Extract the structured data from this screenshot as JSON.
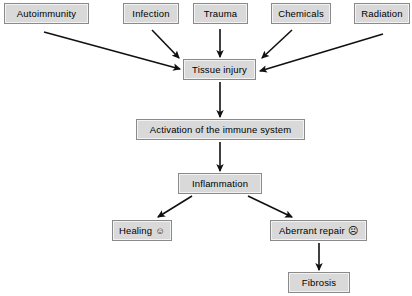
{
  "diagram": {
    "colors": {
      "box_fill": "#d9d9d9",
      "box_border": "#8a8a8a",
      "arrow": "#111111",
      "background": "#ffffff",
      "text": "#000000"
    },
    "nodes": [
      {
        "id": "autoimmunity",
        "label": "Autoimmunity",
        "x": 4,
        "y": 3,
        "w": 85,
        "h": 21,
        "face": ""
      },
      {
        "id": "infection",
        "label": "Infection",
        "x": 123,
        "y": 3,
        "w": 56,
        "h": 21,
        "face": ""
      },
      {
        "id": "trauma",
        "label": "Trauma",
        "x": 193,
        "y": 3,
        "w": 55,
        "h": 21,
        "face": ""
      },
      {
        "id": "chemicals",
        "label": "Chemicals",
        "x": 271,
        "y": 3,
        "w": 60,
        "h": 21,
        "face": ""
      },
      {
        "id": "radiation",
        "label": "Radiation",
        "x": 354,
        "y": 3,
        "w": 56,
        "h": 21,
        "face": ""
      },
      {
        "id": "tissue-injury",
        "label": "Tissue injury",
        "x": 183,
        "y": 59,
        "w": 73,
        "h": 21,
        "face": ""
      },
      {
        "id": "activation",
        "label": "Activation of the immune system",
        "x": 136,
        "y": 119,
        "w": 169,
        "h": 21,
        "face": ""
      },
      {
        "id": "inflammation",
        "label": "Inflammation",
        "x": 178,
        "y": 173,
        "w": 84,
        "h": 21,
        "face": ""
      },
      {
        "id": "healing",
        "label": "Healing",
        "x": 112,
        "y": 220,
        "w": 60,
        "h": 21,
        "face": "☺"
      },
      {
        "id": "aberrant-repair",
        "label": "Aberrant repair",
        "x": 270,
        "y": 220,
        "w": 97,
        "h": 21,
        "face": "☹"
      },
      {
        "id": "fibrosis",
        "label": "Fibrosis",
        "x": 288,
        "y": 272,
        "w": 62,
        "h": 21,
        "face": ""
      }
    ],
    "edges": [
      {
        "id": "autoimmunity-to-tissue-injury",
        "from": "autoimmunity",
        "to": "tissue-injury",
        "x1": 44,
        "y1": 32,
        "x2": 180,
        "y2": 69
      },
      {
        "id": "infection-to-tissue-injury",
        "from": "infection",
        "to": "tissue-injury",
        "x1": 152,
        "y1": 30,
        "x2": 179,
        "y2": 58
      },
      {
        "id": "trauma-to-tissue-injury",
        "from": "trauma",
        "to": "tissue-injury",
        "x1": 220,
        "y1": 29,
        "x2": 220,
        "y2": 57
      },
      {
        "id": "chemicals-to-tissue-injury",
        "from": "chemicals",
        "to": "tissue-injury",
        "x1": 292,
        "y1": 30,
        "x2": 262,
        "y2": 58
      },
      {
        "id": "radiation-to-tissue-injury",
        "from": "radiation",
        "to": "tissue-injury",
        "x1": 383,
        "y1": 34,
        "x2": 260,
        "y2": 71
      },
      {
        "id": "tissue-injury-to-activation",
        "from": "tissue-injury",
        "to": "activation",
        "x1": 220,
        "y1": 82,
        "x2": 220,
        "y2": 117
      },
      {
        "id": "activation-to-inflammation",
        "from": "activation",
        "to": "inflammation",
        "x1": 220,
        "y1": 142,
        "x2": 220,
        "y2": 171
      },
      {
        "id": "inflammation-to-healing",
        "from": "inflammation",
        "to": "healing",
        "x1": 192,
        "y1": 196,
        "x2": 158,
        "y2": 217
      },
      {
        "id": "inflammation-to-aberrant-repair",
        "from": "inflammation",
        "to": "aberrant-repair",
        "x1": 248,
        "y1": 196,
        "x2": 292,
        "y2": 217
      },
      {
        "id": "aberrant-repair-to-fibrosis",
        "from": "aberrant-repair",
        "to": "fibrosis",
        "x1": 319,
        "y1": 243,
        "x2": 319,
        "y2": 270
      }
    ]
  }
}
